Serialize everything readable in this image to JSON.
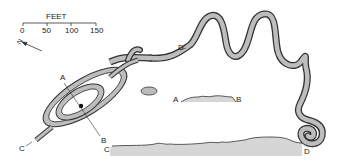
{
  "scale": {
    "title": "FEET",
    "ticks": [
      "0",
      "50",
      "100",
      "150"
    ]
  },
  "north_arrow": {
    "label": "N"
  },
  "labels": {
    "a_plan": "A",
    "b_plan": "B",
    "c_plan": "C",
    "d_plan": "D",
    "a_profile": "A",
    "b_profile": "B",
    "c_profile": "C",
    "d_profile": "D"
  },
  "colors": {
    "body_fill": "#b8b8b8",
    "outline": "#333333",
    "profile_fill": "#d6d6d6"
  }
}
